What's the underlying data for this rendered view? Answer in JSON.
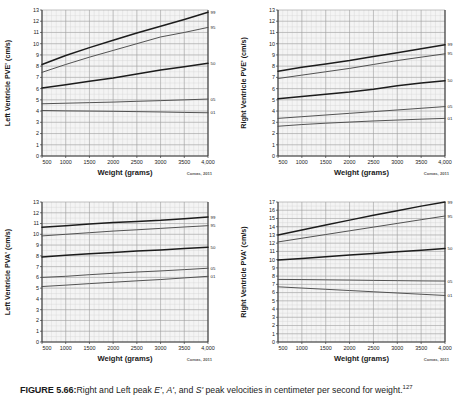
{
  "figure": {
    "caption_label": "FIGURE 5.66:",
    "caption_text_a": "Right and Left peak ",
    "caption_italic_e": "E'",
    "caption_text_b": ", ",
    "caption_italic_a": "A'",
    "caption_text_c": ", and ",
    "caption_italic_s": "S'",
    "caption_text_d": " peak velocities in centimeter per second for weight.",
    "caption_superscript": "127",
    "source_note": "Comas, 2011"
  },
  "style": {
    "grid_major": "#9b9b9b",
    "grid_minor": "#d2d2d2",
    "axis_color": "#3a3a3a",
    "curve_dark": "#1c1c1c",
    "curve_mid": "#4a4a4a",
    "panel_bg": "#f4f4f4",
    "text_color": "#1a1a1a"
  },
  "chart_data": [
    {
      "id": "left-ventricle-pve",
      "type": "line",
      "title": "",
      "ylabel": "Left Ventricle PVE' (cm/s)",
      "xlabel": "Weight (grams)",
      "source": "Comas, 2011",
      "grid": true,
      "legend_position": "right-axis",
      "xlim": [
        500,
        4000
      ],
      "ylim": [
        0,
        13
      ],
      "xticks": [
        500,
        1000,
        1500,
        2000,
        2500,
        3000,
        3500,
        4000
      ],
      "xticklabels": [
        "500",
        "1000",
        "1500",
        "2000",
        "2500",
        "3000",
        "3500",
        "4,000"
      ],
      "yticks": [
        0,
        1,
        2,
        3,
        4,
        5,
        6,
        7,
        8,
        9,
        10,
        11,
        12,
        13
      ],
      "yticklabels": [
        "0",
        "1",
        "2",
        "3",
        "4",
        "5",
        "6",
        "7",
        "8",
        "9",
        "10",
        "11",
        "12",
        "13"
      ],
      "x": [
        500,
        1000,
        1500,
        2000,
        2500,
        3000,
        3500,
        4000
      ],
      "series": [
        {
          "name": "99",
          "label": "99",
          "weight": "bold",
          "values": [
            8.15,
            8.95,
            9.65,
            10.3,
            10.95,
            11.55,
            12.15,
            12.8
          ]
        },
        {
          "name": "95",
          "label": "95",
          "weight": "normal",
          "values": [
            7.45,
            8.15,
            8.8,
            9.4,
            10.0,
            10.6,
            11.0,
            11.45
          ]
        },
        {
          "name": "50",
          "label": "50",
          "weight": "bold",
          "values": [
            6.05,
            6.35,
            6.65,
            6.95,
            7.3,
            7.65,
            7.95,
            8.25
          ]
        },
        {
          "name": "05",
          "label": "05",
          "weight": "normal",
          "values": [
            4.65,
            4.7,
            4.75,
            4.8,
            4.87,
            4.93,
            5.0,
            5.07
          ]
        },
        {
          "name": "01",
          "label": "01",
          "weight": "normal",
          "values": [
            4.05,
            4.02,
            4.0,
            3.98,
            3.95,
            3.92,
            3.88,
            3.85
          ]
        }
      ]
    },
    {
      "id": "right-ventricle-pve",
      "type": "line",
      "title": "",
      "ylabel": "Right Ventricle PVE' (cm/s)",
      "xlabel": "Weight (grams)",
      "source": "Comas, 2011",
      "grid": true,
      "legend_position": "right-axis",
      "xlim": [
        500,
        4000
      ],
      "ylim": [
        0,
        13
      ],
      "xticks": [
        500,
        1000,
        1500,
        2000,
        2500,
        3000,
        3500,
        4000
      ],
      "xticklabels": [
        "500",
        "1000",
        "1500",
        "2000",
        "2500",
        "3000",
        "3500",
        "4,000"
      ],
      "yticks": [
        0,
        1,
        2,
        3,
        4,
        5,
        6,
        7,
        8,
        9,
        10,
        11,
        12,
        13
      ],
      "yticklabels": [
        "0",
        "1",
        "2",
        "3",
        "4",
        "5",
        "6",
        "7",
        "8",
        "9",
        "10",
        "11",
        "12",
        "13"
      ],
      "x": [
        500,
        1000,
        1500,
        2000,
        2500,
        3000,
        3500,
        4000
      ],
      "series": [
        {
          "name": "99",
          "label": "99",
          "weight": "bold",
          "values": [
            7.55,
            7.9,
            8.2,
            8.5,
            8.85,
            9.2,
            9.55,
            9.9
          ]
        },
        {
          "name": "95",
          "label": "95",
          "weight": "normal",
          "values": [
            6.9,
            7.2,
            7.5,
            7.8,
            8.15,
            8.5,
            8.8,
            9.1
          ]
        },
        {
          "name": "50",
          "label": "50",
          "weight": "bold",
          "values": [
            5.1,
            5.3,
            5.5,
            5.7,
            5.95,
            6.25,
            6.5,
            6.7
          ]
        },
        {
          "name": "05",
          "label": "05",
          "weight": "normal",
          "values": [
            3.35,
            3.5,
            3.65,
            3.8,
            3.95,
            4.1,
            4.25,
            4.4
          ]
        },
        {
          "name": "01",
          "label": "01",
          "weight": "normal",
          "values": [
            2.65,
            2.8,
            2.92,
            3.02,
            3.12,
            3.2,
            3.28,
            3.35
          ]
        }
      ]
    },
    {
      "id": "left-ventricle-pva",
      "type": "line",
      "title": "",
      "ylabel": "Left Ventricle PVA' (cm/s)",
      "xlabel": "Weight (grams)",
      "source": "Comas, 2011",
      "grid": true,
      "legend_position": "right-axis",
      "xlim": [
        500,
        4000
      ],
      "ylim": [
        0,
        13
      ],
      "xticks": [
        500,
        1000,
        1500,
        2000,
        2500,
        3000,
        3500,
        4000
      ],
      "xticklabels": [
        "500",
        "1000",
        "1500",
        "2000",
        "2500",
        "3000",
        "3500",
        "4,000"
      ],
      "yticks": [
        0,
        1,
        2,
        3,
        4,
        5,
        6,
        7,
        8,
        9,
        10,
        11,
        12,
        13
      ],
      "yticklabels": [
        "0",
        "1",
        "2",
        "3",
        "4",
        "5",
        "6",
        "7",
        "8",
        "9",
        "10",
        "11",
        "12",
        "13"
      ],
      "x": [
        500,
        1000,
        1500,
        2000,
        2500,
        3000,
        3500,
        4000
      ],
      "series": [
        {
          "name": "99",
          "label": "99",
          "weight": "bold",
          "values": [
            10.65,
            10.8,
            10.95,
            11.1,
            11.2,
            11.3,
            11.45,
            11.6
          ]
        },
        {
          "name": "95",
          "label": "95",
          "weight": "normal",
          "values": [
            9.85,
            10.0,
            10.15,
            10.3,
            10.42,
            10.55,
            10.68,
            10.8
          ]
        },
        {
          "name": "50",
          "label": "50",
          "weight": "bold",
          "values": [
            7.9,
            8.05,
            8.2,
            8.32,
            8.45,
            8.55,
            8.68,
            8.8
          ]
        },
        {
          "name": "05",
          "label": "05",
          "weight": "normal",
          "values": [
            6.0,
            6.1,
            6.25,
            6.38,
            6.5,
            6.6,
            6.72,
            6.85
          ]
        },
        {
          "name": "01",
          "label": "01",
          "weight": "normal",
          "values": [
            5.15,
            5.28,
            5.42,
            5.55,
            5.68,
            5.8,
            5.95,
            6.1
          ]
        }
      ]
    },
    {
      "id": "right-ventricle-pva",
      "type": "line",
      "title": "",
      "ylabel": "Right Ventricle PVA' (cm/s)",
      "xlabel": "Weight (grams)",
      "source": "Comas, 2011",
      "grid": true,
      "legend_position": "right-axis",
      "xlim": [
        500,
        4000
      ],
      "ylim": [
        0,
        17
      ],
      "xticks": [
        500,
        1000,
        1500,
        2000,
        2500,
        3000,
        3500,
        4000
      ],
      "xticklabels": [
        "500",
        "1000",
        "1500",
        "2000",
        "2500",
        "3000",
        "3500",
        "4,000"
      ],
      "yticks": [
        0,
        1,
        2,
        3,
        4,
        5,
        6,
        7,
        8,
        9,
        10,
        11,
        12,
        13,
        14,
        15,
        16,
        17
      ],
      "yticklabels": [
        "0",
        "1",
        "2",
        "3",
        "4",
        "5",
        "6",
        "7",
        "8",
        "9",
        "10",
        "11",
        "12",
        "13",
        "14",
        "15",
        "16",
        "17"
      ],
      "x": [
        500,
        1000,
        1500,
        2000,
        2500,
        3000,
        3500,
        4000
      ],
      "series": [
        {
          "name": "99",
          "label": "99",
          "weight": "bold",
          "values": [
            13.0,
            13.6,
            14.2,
            14.8,
            15.4,
            15.95,
            16.5,
            17.0
          ]
        },
        {
          "name": "95",
          "label": "95",
          "weight": "normal",
          "values": [
            12.15,
            12.6,
            13.05,
            13.5,
            13.95,
            14.4,
            14.85,
            15.3
          ]
        },
        {
          "name": "50",
          "label": "50",
          "weight": "bold",
          "values": [
            9.95,
            10.15,
            10.35,
            10.55,
            10.75,
            10.95,
            11.15,
            11.35
          ]
        },
        {
          "name": "05",
          "label": "05",
          "weight": "normal",
          "values": [
            7.6,
            7.58,
            7.55,
            7.52,
            7.48,
            7.45,
            7.42,
            7.4
          ]
        },
        {
          "name": "01",
          "label": "01",
          "weight": "normal",
          "values": [
            6.7,
            6.55,
            6.4,
            6.25,
            6.1,
            5.95,
            5.8,
            5.65
          ]
        }
      ]
    }
  ]
}
